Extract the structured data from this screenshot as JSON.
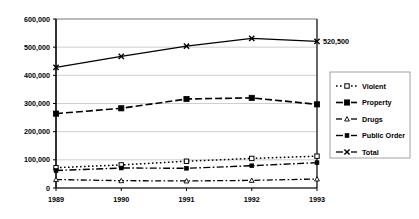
{
  "chart_data": {
    "type": "line",
    "title": "",
    "subtitle": "",
    "xlabel": "",
    "ylabel": "",
    "categories": [
      "1989",
      "1990",
      "1991",
      "1992",
      "1993"
    ],
    "x_tick_labels": [
      "1989",
      "1990",
      "1991",
      "1992",
      "1993"
    ],
    "y_tick_labels": [
      "0",
      "100,000",
      "200,000",
      "300,000",
      "400,000",
      "500,000",
      "600,000"
    ],
    "y_tick_values": [
      0,
      100000,
      200000,
      300000,
      400000,
      500000,
      600000
    ],
    "ylim": [
      0,
      600000
    ],
    "grid": "horizontal",
    "legend_position": "right",
    "series": [
      {
        "name": "Violent",
        "line_style": "dotted",
        "marker": "open-square",
        "values": [
          72000,
          82000,
          95000,
          105000,
          113000
        ]
      },
      {
        "name": "Property",
        "line_style": "dashed",
        "marker": "filled-square",
        "values": [
          264000,
          283000,
          316000,
          320000,
          297000
        ]
      },
      {
        "name": "Drugs",
        "line_style": "dash-dot",
        "marker": "triangle",
        "values": [
          30000,
          26000,
          25000,
          27000,
          32000
        ]
      },
      {
        "name": "Public Order",
        "line_style": "dash-dot-long",
        "marker": "small-filled-square",
        "values": [
          62000,
          71000,
          70000,
          79000,
          90000
        ]
      },
      {
        "name": "Total",
        "line_style": "solid",
        "marker": "cross-x",
        "values": [
          428000,
          467000,
          504000,
          531000,
          520500
        ]
      }
    ],
    "annotations": [
      {
        "text": "520,500",
        "series": "Total",
        "category": "1993",
        "value": 520500
      }
    ],
    "colors": {
      "series_stroke": "#000000",
      "grid": "#b9b9b9",
      "axis": "#000000",
      "plot_background": "#ffffff",
      "legend_border": "#8a8a8a"
    }
  },
  "legend": {
    "items": [
      {
        "label": "Violent"
      },
      {
        "label": "Property"
      },
      {
        "label": "Drugs"
      },
      {
        "label": "Public Order"
      },
      {
        "label": "Total"
      }
    ]
  }
}
